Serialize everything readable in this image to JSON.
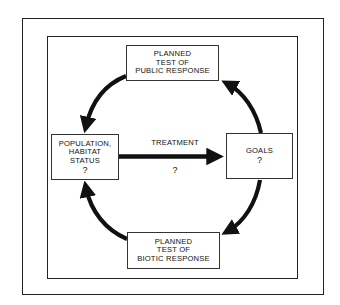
{
  "diagram": {
    "type": "cycle",
    "nodes": {
      "top": {
        "lines": [
          "PLANNED",
          "TEST OF",
          "PUBLIC RESPONSE"
        ]
      },
      "left": {
        "lines": [
          "POPULATION,",
          "HABITAT",
          "STATUS",
          "?"
        ]
      },
      "right": {
        "lines": [
          "GOALS",
          "?"
        ]
      },
      "bottom": {
        "lines": [
          "PLANNED",
          "TEST OF",
          "BIOTIC RESPONSE"
        ]
      }
    },
    "center_arrow": {
      "label": "TREATMENT",
      "sublabel": "?",
      "from": "left",
      "to": "right"
    },
    "cycle_arrows": [
      {
        "from": "top",
        "to": "left"
      },
      {
        "from": "left_bottom",
        "to": "left",
        "note": "bottom to left"
      },
      {
        "from": "right",
        "to": "bottom"
      },
      {
        "from": "right",
        "to": "top"
      }
    ],
    "colors": {
      "line": "#111111",
      "background": "#ffffff"
    }
  }
}
